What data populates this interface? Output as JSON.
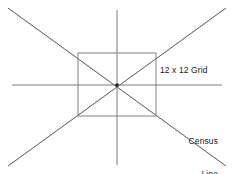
{
  "canvas": {
    "width": 234,
    "height": 174,
    "background_color": "#ffffff"
  },
  "labels": {
    "grid_label": "12 x 12 Grid",
    "census_label_line1": "Census",
    "census_label_line2": "Line"
  },
  "colors": {
    "axis_line": "#7a7a7a",
    "census_line": "#555555",
    "grid_rect": "#808080",
    "center_dot": "#1a1a1a",
    "text": "#1a1a1a"
  },
  "geometry": {
    "center": {
      "x": 117,
      "y": 85
    },
    "horizontal_axis": {
      "x1": 12,
      "y1": 85,
      "x2": 222,
      "y2": 85
    },
    "vertical_axis": {
      "x1": 117,
      "y1": 10,
      "x2": 117,
      "y2": 165
    },
    "census_line_a": {
      "x1": 8,
      "y1": 8,
      "x2": 226,
      "y2": 166
    },
    "census_line_b": {
      "x1": 226,
      "y1": 8,
      "x2": 8,
      "y2": 166
    },
    "grid_rect": {
      "x": 78,
      "y": 53,
      "width": 78,
      "height": 63
    }
  },
  "chart_data": {
    "type": "diagram",
    "elements": [
      {
        "name": "horizontal-axis",
        "kind": "line",
        "from": [
          12,
          85
        ],
        "to": [
          222,
          85
        ],
        "color": "#7a7a7a"
      },
      {
        "name": "vertical-axis",
        "kind": "line",
        "from": [
          117,
          10
        ],
        "to": [
          117,
          165
        ],
        "color": "#7a7a7a"
      },
      {
        "name": "census-line-descending",
        "kind": "line",
        "from": [
          8,
          8
        ],
        "to": [
          226,
          166
        ],
        "color": "#555555",
        "label": "Census Line"
      },
      {
        "name": "census-line-ascending",
        "kind": "line",
        "from": [
          226,
          8
        ],
        "to": [
          8,
          166
        ],
        "color": "#555555",
        "label": "Census Line"
      },
      {
        "name": "grid-rectangle",
        "kind": "rect",
        "corners": [
          [
            78,
            53
          ],
          [
            156,
            53
          ],
          [
            156,
            116
          ],
          [
            78,
            116
          ]
        ],
        "color": "#808080",
        "label": "12 x 12 Grid"
      },
      {
        "name": "center-point",
        "kind": "point",
        "at": [
          117,
          85
        ],
        "color": "#1a1a1a"
      }
    ],
    "annotations": [
      {
        "text": "12 x 12 Grid",
        "at": [
          160,
          71
        ],
        "anchor": "left"
      },
      {
        "text": "Census Line",
        "at": [
          218,
          126
        ],
        "anchor": "right"
      }
    ]
  }
}
